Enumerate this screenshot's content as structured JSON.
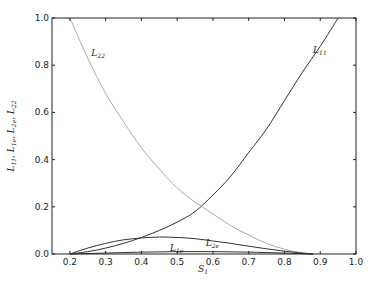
{
  "chart_data": {
    "type": "line",
    "title": "",
    "xlabel": "S1",
    "ylabel": "L11, L1e, L2e, L22",
    "xlim": [
      0.15,
      1.0
    ],
    "ylim": [
      0.0,
      1.0
    ],
    "grid": false,
    "legend": "none (inline curve labels)",
    "xticks": [
      "0.2",
      "0.3",
      "0.4",
      "0.5",
      "0.6",
      "0.7",
      "0.8",
      "0.9",
      "1.0"
    ],
    "yticks": [
      "0.0",
      "0.2",
      "0.4",
      "0.6",
      "0.8",
      "1.0"
    ],
    "series": [
      {
        "name": "L11",
        "color": "#333333",
        "label_pos": [
          0.88,
          0.85
        ],
        "x": [
          0.2,
          0.25,
          0.3,
          0.35,
          0.4,
          0.45,
          0.5,
          0.55,
          0.6,
          0.65,
          0.7,
          0.75,
          0.8,
          0.85,
          0.9,
          0.95
        ],
        "y": [
          0.0,
          0.01,
          0.025,
          0.045,
          0.07,
          0.1,
          0.135,
          0.18,
          0.25,
          0.33,
          0.43,
          0.53,
          0.65,
          0.77,
          0.88,
          1.0
        ]
      },
      {
        "name": "L22",
        "color": "#aaaaaa",
        "label_pos": [
          0.26,
          0.84
        ],
        "x": [
          0.2,
          0.25,
          0.3,
          0.35,
          0.4,
          0.45,
          0.5,
          0.55,
          0.6,
          0.65,
          0.7,
          0.75,
          0.8,
          0.85,
          0.88
        ],
        "y": [
          1.0,
          0.83,
          0.68,
          0.56,
          0.45,
          0.36,
          0.28,
          0.22,
          0.17,
          0.12,
          0.08,
          0.045,
          0.02,
          0.005,
          0.0
        ]
      },
      {
        "name": "L2e",
        "color": "#333333",
        "label_pos": [
          0.58,
          0.035
        ],
        "x": [
          0.2,
          0.25,
          0.3,
          0.35,
          0.4,
          0.45,
          0.5,
          0.55,
          0.6,
          0.65,
          0.7,
          0.75,
          0.8,
          0.85,
          0.88
        ],
        "y": [
          0.0,
          0.025,
          0.045,
          0.06,
          0.068,
          0.072,
          0.07,
          0.065,
          0.055,
          0.045,
          0.033,
          0.022,
          0.012,
          0.004,
          0.0
        ]
      },
      {
        "name": "L1e",
        "color": "#333333",
        "label_pos": [
          0.48,
          0.012
        ],
        "x": [
          0.2,
          0.3,
          0.4,
          0.5,
          0.6,
          0.7,
          0.8,
          0.88
        ],
        "y": [
          0.0,
          0.004,
          0.008,
          0.01,
          0.01,
          0.008,
          0.004,
          0.0
        ]
      }
    ]
  }
}
